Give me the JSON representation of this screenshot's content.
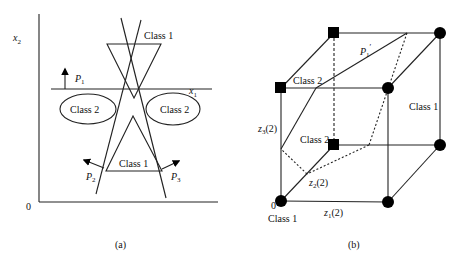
{
  "figure": {
    "panel_a": {
      "caption": "(a)",
      "axis_x_label": "x",
      "axis_x_sub": "1",
      "axis_y_label": "x",
      "axis_y_sub": "2",
      "origin_label": "0",
      "regions": {
        "class1_top": "Class 1",
        "class2_left": "Class 2",
        "class2_right": "Class 2",
        "class1_bottom": "Class 1"
      },
      "planes": {
        "p1": "P",
        "p1_sub": "1",
        "p2": "P",
        "p2_sub": "2",
        "p3": "P",
        "p3_sub": "3"
      }
    },
    "panel_b": {
      "caption": "(b)",
      "origin_label": "0",
      "axis_z1": "z",
      "axis_z1_sub": "1",
      "axis_z1_arg": "(2)",
      "axis_z2": "z",
      "axis_z2_sub": "2",
      "axis_z2_arg": "(2)",
      "axis_z3": "z",
      "axis_z3_sub": "3",
      "axis_z3_arg": "(2)",
      "plane_label": "P",
      "plane_sub": "1",
      "plane_prime": "′",
      "labels": {
        "class1_origin": "Class 1",
        "class1_right": "Class 1",
        "class2_top": "Class 2",
        "class2_mid": "Class 2"
      },
      "legend": {
        "class1_marker": "circle",
        "class2_marker": "square"
      }
    },
    "colors": {
      "stroke": "#222222",
      "marker": "#000000",
      "background": "#ffffff"
    }
  }
}
